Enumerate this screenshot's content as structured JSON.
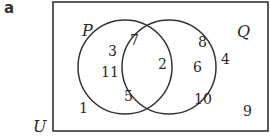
{
  "part_label": "a",
  "universal_set": {
    "label": "U"
  },
  "sets": [
    {
      "label": "P"
    },
    {
      "label": "Q"
    }
  ],
  "regions": {
    "P_only": [
      "3",
      "7",
      "11",
      "5"
    ],
    "P_and_Q": [
      "2"
    ],
    "Q_only": [
      "8",
      "6",
      "4",
      "10"
    ],
    "outside": [
      "1",
      "9"
    ]
  },
  "colors": {
    "line": "#333333",
    "text": "#2a2a2a",
    "background": "#ffffff"
  }
}
